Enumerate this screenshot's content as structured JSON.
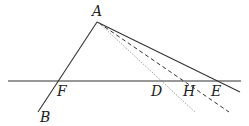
{
  "diagram": {
    "type": "geometry",
    "points": {
      "A": {
        "label": "A",
        "x": 97,
        "y": 22,
        "label_x": 92,
        "label_y": 16
      },
      "B": {
        "label": "B",
        "x": 38,
        "y": 112,
        "label_x": 40,
        "label_y": 122
      },
      "F": {
        "label": "F",
        "x": 58,
        "y": 81,
        "label_x": 57,
        "label_y": 96
      },
      "D": {
        "label": "D",
        "x": 163,
        "y": 81,
        "label_x": 151,
        "label_y": 96
      },
      "H": {
        "label": "H",
        "x": 186,
        "y": 81,
        "label_x": 183,
        "label_y": 96
      },
      "E": {
        "label": "E",
        "x": 220,
        "y": 81,
        "label_x": 211,
        "label_y": 96
      }
    },
    "lines": [
      {
        "name": "baseline",
        "style": "solid",
        "x1": 8,
        "y1": 81,
        "x2": 241,
        "y2": 81
      },
      {
        "name": "segment-AB",
        "style": "solid",
        "x1": 97,
        "y1": 22,
        "x2": 38,
        "y2": 112
      },
      {
        "name": "ray-AE",
        "style": "solid",
        "x1": 97,
        "y1": 22,
        "x2": 240,
        "y2": 92
      },
      {
        "name": "ray-AH",
        "style": "dashed",
        "x1": 99,
        "y1": 23,
        "x2": 229,
        "y2": 112
      },
      {
        "name": "ray-AD",
        "style": "dotted",
        "x1": 99,
        "y1": 23,
        "x2": 196,
        "y2": 113
      }
    ],
    "colors": {
      "line": "#333333",
      "dotted": "#777777",
      "label": "#222222"
    }
  }
}
